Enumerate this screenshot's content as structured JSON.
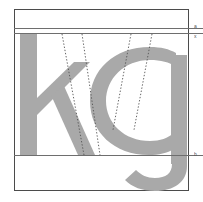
{
  "figure": {
    "kind": "type-specimen",
    "glyph_string": "kg",
    "background_color": "#ffffff",
    "frame_color": "#4b4b4b",
    "guideline_color": "#6e6e6e",
    "glyph_color": "#a9a9a9",
    "dotted_line_color": "#555555"
  },
  "frame": {
    "label": "specimen-frame",
    "x": 14,
    "y": 9,
    "width": 175,
    "height": 182
  },
  "glyphs": [
    {
      "character": "k",
      "name": "letter-k",
      "color": "#a9a9a9",
      "x": 18,
      "y": 33,
      "width": 72,
      "height": 122
    },
    {
      "character": "g",
      "name": "letter-g",
      "color": "#a9a9a9",
      "x": 104,
      "y": 55,
      "width": 82,
      "height": 133
    }
  ],
  "guidelines": [
    {
      "name": "ascender-line",
      "label": "a",
      "y": 28
    },
    {
      "name": "x-height-line",
      "label": "x",
      "y": 33
    },
    {
      "name": "baseline",
      "label": "b",
      "y": 155
    }
  ],
  "construction_lines": {
    "name": "dotted-angle-guides",
    "count": 4,
    "style": "dotted",
    "color": "#555555",
    "segments": [
      {
        "name": "k-left-diagonal",
        "x1": 62,
        "y1": 34,
        "x2": 84,
        "y2": 155
      },
      {
        "name": "k-right-diagonal",
        "x1": 82,
        "y1": 34,
        "x2": 100,
        "y2": 155
      },
      {
        "name": "g-left-diagonal",
        "x1": 131,
        "y1": 34,
        "x2": 113,
        "y2": 130
      },
      {
        "name": "g-right-diagonal",
        "x1": 152,
        "y1": 34,
        "x2": 134,
        "y2": 130
      }
    ]
  }
}
